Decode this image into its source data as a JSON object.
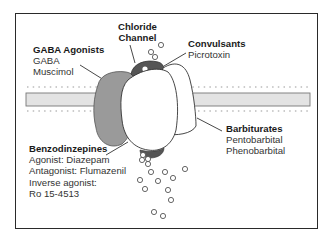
{
  "diagram": {
    "labels": {
      "gaba_agonists": {
        "title": "GABA Agonists",
        "items": [
          "GABA",
          "Muscimol"
        ]
      },
      "chloride_channel": {
        "title_line1": "Chloride",
        "title_line2": "Channel"
      },
      "convulsants": {
        "title": "Convulsants",
        "items": [
          "Picrotoxin"
        ]
      },
      "barbiturates": {
        "title": "Barbiturates",
        "items": [
          "Pentobarbital",
          "Phenobarbital"
        ]
      },
      "benzodiazepines": {
        "title": "Benzodinzepines",
        "items": [
          "Agonist: Diazepam",
          "Antagonist: Flumazenil",
          "Inverse agonist:",
          "Ro 15-4513"
        ]
      }
    },
    "colors": {
      "frame": "#2a2a2a",
      "membrane_fill": "#e3e3e3",
      "gaba_subunit": "#9a9a9a",
      "channel_subunit": "#555555",
      "white_subunit": "#ffffff",
      "ion": "#ffffff"
    }
  }
}
